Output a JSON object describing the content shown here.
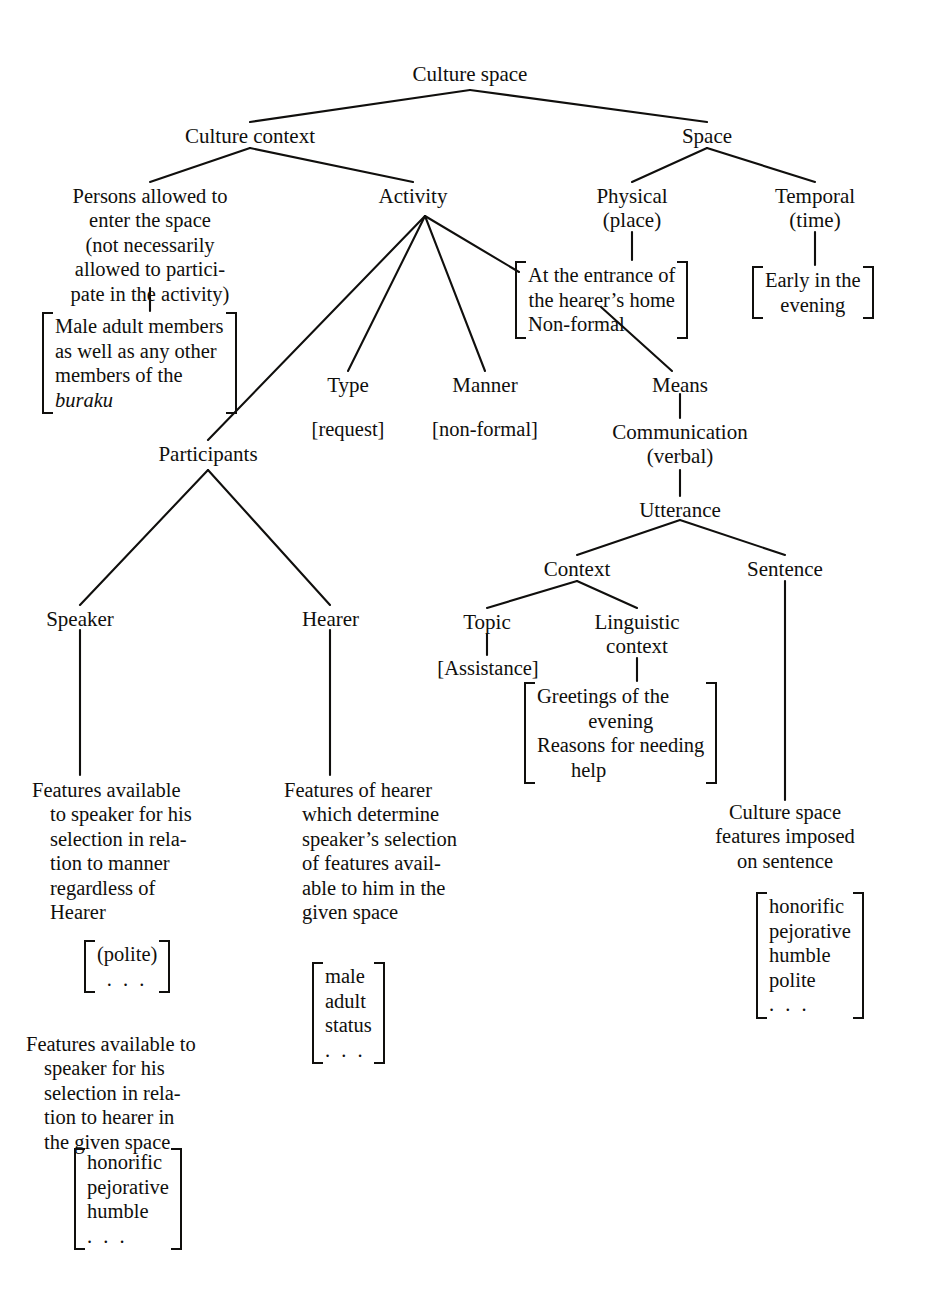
{
  "figure": {
    "type": "tree-diagram",
    "title": "Culture space",
    "root_label": "Culture space"
  },
  "nodes": {
    "culture_space": "Culture space",
    "culture_context": "Culture context",
    "space": "Space",
    "persons_allowed": "Persons allowed to\nenter the space\n(not necessarily\nallowed to partici-\npate in the activity)",
    "activity": "Activity",
    "physical": "Physical\n(place)",
    "temporal": "Temporal\n(time)",
    "type": "Type",
    "manner": "Manner",
    "means": "Means",
    "communication": "Communication\n(verbal)",
    "utterance": "Utterance",
    "context": "Context",
    "sentence": "Sentence",
    "topic": "Topic",
    "linguistic_context": "Linguistic\ncontext",
    "participants": "Participants",
    "speaker": "Speaker",
    "hearer": "Hearer"
  },
  "feature_labels": {
    "type_value": "[request]",
    "manner_value": "[non-formal]",
    "topic_value": "[Assistance]"
  },
  "matrices": {
    "persons_features": [
      "Male adult members",
      "as well as any other",
      "members of the",
      "buraku"
    ],
    "persons_features_italic_line": "buraku",
    "physical_features": [
      "At the entrance of",
      "the hearer’s home",
      "Non-formal"
    ],
    "temporal_features": [
      "Early in the",
      "evening"
    ],
    "linguistic_context_features": [
      "Greetings of the",
      "evening",
      "Reasons for needing",
      "help"
    ],
    "speaker_manner_features": [
      "(polite)",
      ". . ."
    ],
    "speaker_hearer_features": [
      "honorific",
      "pejorative",
      "humble",
      ". . ."
    ],
    "hearer_features": [
      "male",
      "adult",
      "status",
      ". . ."
    ],
    "sentence_features": [
      "honorific",
      "pejorative",
      "humble",
      "polite",
      ". . ."
    ]
  },
  "descriptions": {
    "speaker_block_1": "Features available\nto speaker for his\nselection in rela-\ntion to manner\nregardless of\nHearer",
    "speaker_block_2": "Features available to\nspeaker for his\nselection in rela-\ntion to hearer in\nthe given space",
    "hearer_block": "Features of hearer\nwhich determine\nspeaker’s selection\nof features avail-\nable to him in the\ngiven space",
    "sentence_block": "Culture space\nfeatures imposed\non sentence"
  },
  "style": {
    "ink": "#100f0d",
    "background": "#ffffff"
  },
  "edges": [
    {
      "from": "culture_space",
      "to": "culture_context"
    },
    {
      "from": "culture_space",
      "to": "space"
    },
    {
      "from": "culture_context",
      "to": "persons_allowed"
    },
    {
      "from": "culture_context",
      "to": "activity"
    },
    {
      "from": "space",
      "to": "physical"
    },
    {
      "from": "space",
      "to": "temporal"
    },
    {
      "from": "persons_allowed",
      "to": "persons_features"
    },
    {
      "from": "activity",
      "to": "participants"
    },
    {
      "from": "activity",
      "to": "type"
    },
    {
      "from": "activity",
      "to": "manner"
    },
    {
      "from": "activity",
      "to": "physical_features"
    },
    {
      "from": "physical",
      "to": "physical_features"
    },
    {
      "from": "temporal",
      "to": "temporal_features"
    },
    {
      "from": "type",
      "to": "type_value"
    },
    {
      "from": "manner",
      "to": "manner_value"
    },
    {
      "from": "physical_features",
      "to": "means"
    },
    {
      "from": "means",
      "to": "communication"
    },
    {
      "from": "communication",
      "to": "utterance"
    },
    {
      "from": "utterance",
      "to": "context"
    },
    {
      "from": "utterance",
      "to": "sentence"
    },
    {
      "from": "context",
      "to": "topic"
    },
    {
      "from": "context",
      "to": "linguistic_context"
    },
    {
      "from": "topic",
      "to": "topic_value"
    },
    {
      "from": "linguistic_context",
      "to": "linguistic_context_features"
    },
    {
      "from": "participants",
      "to": "speaker"
    },
    {
      "from": "participants",
      "to": "hearer"
    },
    {
      "from": "speaker",
      "to": "speaker_block_1"
    },
    {
      "from": "hearer",
      "to": "hearer_block"
    },
    {
      "from": "sentence",
      "to": "sentence_block"
    }
  ]
}
